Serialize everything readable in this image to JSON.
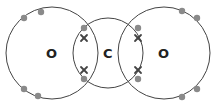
{
  "diagram": {
    "atoms": [
      {
        "symbol": "O",
        "cx": 52,
        "cy": 53,
        "r": 46
      },
      {
        "symbol": "C",
        "cx": 108,
        "cy": 53,
        "r": 35
      },
      {
        "symbol": "O",
        "cx": 164,
        "cy": 53,
        "r": 46
      }
    ],
    "colors": {
      "shell": "#444444",
      "dot_electron": "#8a8a8a",
      "cross_electron": "#444444",
      "label": "#222222"
    },
    "legend": {
      "dot": "oxygen electron",
      "cross": "carbon electron"
    }
  }
}
